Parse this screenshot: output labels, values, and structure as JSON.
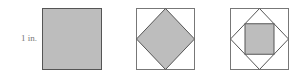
{
  "diagram": {
    "label": "1 in.",
    "fill_color": "#bdbdbd",
    "stroke_color": "#555555",
    "figures": [
      {
        "name": "square",
        "x": 42,
        "y": 8,
        "size": 59
      },
      {
        "name": "square-with-inscribed-diamond",
        "x": 136,
        "y": 8,
        "size": 58
      },
      {
        "name": "square-with-diamond-and-inner-square",
        "x": 230,
        "y": 8,
        "size": 58
      }
    ]
  }
}
